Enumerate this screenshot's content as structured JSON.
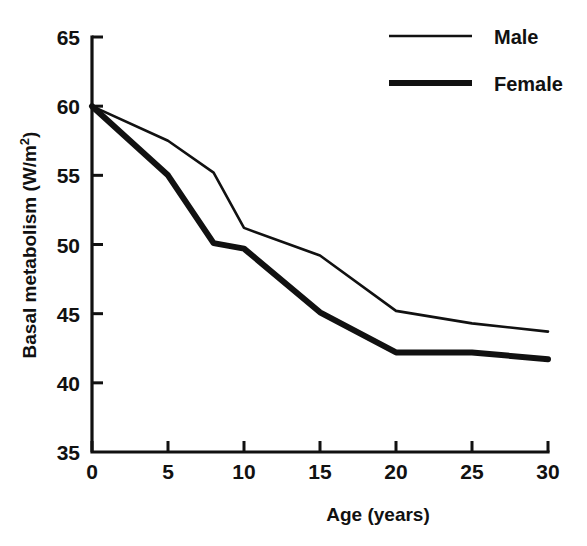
{
  "chart_data": {
    "type": "line",
    "title": "",
    "subtitle": "",
    "xlabel": "Age (years)",
    "ylabel": "Basal metabolism (W/m²)",
    "ylabel_base": "Basal metabolism (W/m",
    "ylabel_sup": "2",
    "ylabel_close": ")",
    "xlim": [
      0,
      30
    ],
    "ylim": [
      35,
      65
    ],
    "xticks": [
      0,
      5,
      10,
      15,
      20,
      25,
      30
    ],
    "yticks": [
      35,
      40,
      45,
      50,
      55,
      60,
      65
    ],
    "xtick_labels": [
      "0",
      "5",
      "10",
      "15",
      "20",
      "25",
      "30"
    ],
    "ytick_labels": [
      "35",
      "40",
      "45",
      "50",
      "55",
      "60",
      "65"
    ],
    "grid": false,
    "legend_position": "top-right",
    "line_color": "#111111",
    "background_color": "#ffffff",
    "series": [
      {
        "name": "Male",
        "style": "thin",
        "x": [
          0,
          5,
          8,
          10,
          15,
          20,
          25,
          30
        ],
        "values": [
          60.0,
          57.5,
          55.2,
          51.2,
          49.2,
          45.2,
          44.3,
          43.7
        ]
      },
      {
        "name": "Female",
        "style": "thick",
        "x": [
          0,
          5,
          8,
          10,
          15,
          20,
          25,
          30
        ],
        "values": [
          60.0,
          55.0,
          50.1,
          49.7,
          45.1,
          42.2,
          42.2,
          41.7
        ]
      }
    ]
  },
  "legend": {
    "entries": [
      {
        "label": "Male"
      },
      {
        "label": "Female"
      }
    ]
  }
}
